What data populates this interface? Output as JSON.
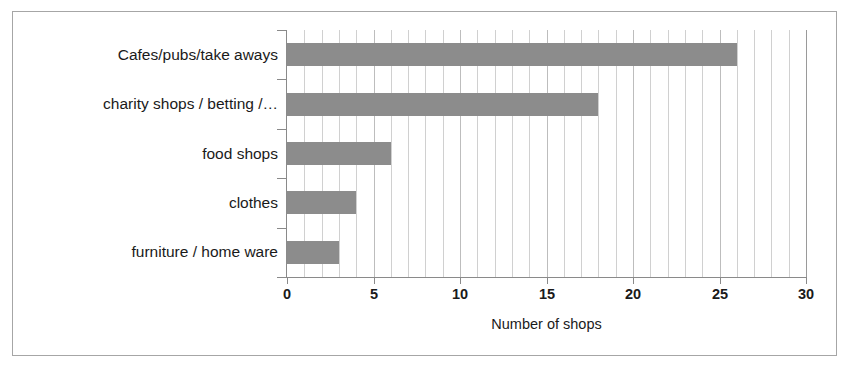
{
  "chart_data": {
    "type": "bar",
    "orientation": "horizontal",
    "title": "",
    "xlabel": "Number of shops",
    "ylabel": "",
    "categories": [
      "Cafes/pubs/take aways",
      "charity shops / betting /…",
      "food shops",
      "clothes",
      "furniture / home ware"
    ],
    "values": [
      26,
      18,
      6,
      4,
      3
    ],
    "xlim": [
      0,
      30
    ],
    "xticks": [
      0,
      5,
      10,
      15,
      20,
      25,
      30
    ],
    "xtick_labels": [
      "0",
      "5",
      "10",
      "15",
      "20",
      "25",
      "30"
    ],
    "minor_gridline_step": 1,
    "grid": "vertical",
    "legend": "none",
    "bar_color": "#8c8c8c",
    "gridline_color": "#d0d0d0",
    "axis_color": "#8a8a8a",
    "frame_color": "#a6a6a6",
    "background_color": "#ffffff",
    "text_color": "#1a1a1a"
  }
}
